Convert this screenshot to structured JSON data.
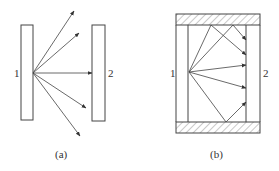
{
  "figure": {
    "panels": [
      {
        "id": "a",
        "caption": "(a)",
        "plate_labels": [
          "1",
          "2"
        ],
        "description": "Two parallel plates, rays from plate 1 escape without walls"
      },
      {
        "id": "b",
        "caption": "(b)",
        "plate_labels": [
          "1",
          "2"
        ],
        "description": "Two parallel plates enclosed by hatched reflecting walls; rays reflect onto plate 2"
      }
    ],
    "colors": {
      "line": "#444444",
      "hatch": "#666666",
      "background": "#ffffff"
    }
  }
}
